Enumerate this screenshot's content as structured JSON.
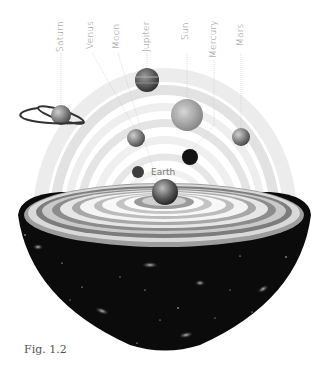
{
  "figure": {
    "caption": "Fig. 1.2",
    "center_label": "Earth"
  },
  "planets": [
    {
      "name": "Saturn",
      "label_x": 61,
      "cx": 61,
      "cy": 115,
      "r": 10,
      "fill": "#b9b9b9",
      "ring": true
    },
    {
      "name": "Venus",
      "label_x": 91,
      "cx": 136,
      "cy": 138,
      "r": 9,
      "fill": "#8c8c8c"
    },
    {
      "name": "Moon",
      "label_x": 117,
      "cx": 138,
      "cy": 172,
      "r": 6,
      "fill": "#4a4a4a"
    },
    {
      "name": "Jupiter",
      "label_x": 147,
      "cx": 147,
      "cy": 80,
      "r": 12,
      "fill": "#6e6e6e"
    },
    {
      "name": "Sun",
      "label_x": 186,
      "cx": 187,
      "cy": 115,
      "r": 16,
      "fill": "#a8a8a8"
    },
    {
      "name": "Mercury",
      "label_x": 214,
      "cx": 190,
      "cy": 157,
      "r": 8,
      "fill": "#151515"
    },
    {
      "name": "Mars",
      "label_x": 241,
      "cx": 241,
      "cy": 137,
      "r": 9,
      "fill": "#8f8f8f"
    }
  ],
  "earth": {
    "cx": 165,
    "cy": 192,
    "r": 13,
    "fill": "#5a5a5a"
  },
  "colors": {
    "hemisphere": "#0b0b0b",
    "label_text": "#8a8a8a",
    "leader_line": "#c8c8c8",
    "caption_text": "#555555"
  }
}
